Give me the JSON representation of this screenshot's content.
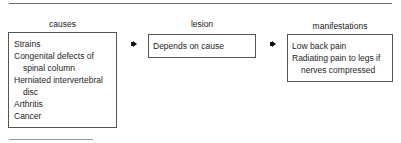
{
  "diagram": {
    "columns": [
      {
        "label": "causes",
        "items": [
          {
            "text": "Strains",
            "indent": false
          },
          {
            "text": "Congenital defects of",
            "indent": false
          },
          {
            "text": "spinal column",
            "indent": true
          },
          {
            "text": "Herniated intervertebral",
            "indent": false
          },
          {
            "text": "disc",
            "indent": true
          },
          {
            "text": "Arthritis",
            "indent": false
          },
          {
            "text": "Cancer",
            "indent": false
          }
        ]
      },
      {
        "label": "lesion",
        "items": [
          {
            "text": "Depends on cause",
            "indent": false
          }
        ]
      },
      {
        "label": "manifestations",
        "items": [
          {
            "text": "Low back pain",
            "indent": false
          },
          {
            "text": "Radiating pain to legs if",
            "indent": false
          },
          {
            "text": "nerves compressed",
            "indent": true
          }
        ]
      }
    ],
    "arrows": [
      {
        "from": "causes",
        "to": "lesion",
        "icon": "arrow-right-icon"
      },
      {
        "from": "lesion",
        "to": "manifestations",
        "icon": "arrow-right-icon"
      }
    ],
    "colors": {
      "border": "#555555",
      "text": "#1e1e1e",
      "rule": "#6a6a6a"
    }
  }
}
